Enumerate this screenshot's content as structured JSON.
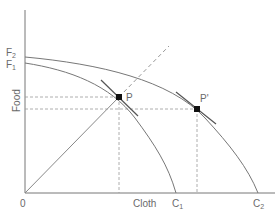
{
  "diagram": {
    "axes": {
      "y_label": "Food",
      "x_label": "Cloth",
      "origin_label": "0"
    },
    "curves": [
      {
        "name": "F1C1",
        "start_label": "F",
        "start_sub": "1",
        "end_label": "C",
        "end_sub": "1"
      },
      {
        "name": "F2C2",
        "start_label": "F",
        "start_sub": "2",
        "end_label": "C",
        "end_sub": "2"
      }
    ],
    "points": [
      {
        "name": "P",
        "label": "P"
      },
      {
        "name": "P-prime",
        "label": "P'"
      }
    ],
    "colors": {
      "axis": "#777777",
      "curve": "#777777",
      "point": "#111111",
      "dashed": "#888888",
      "text": "#6a6a6a"
    }
  }
}
